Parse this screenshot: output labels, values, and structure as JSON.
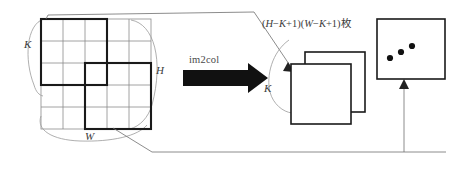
{
  "figure": {
    "kind": "im2col-diagram",
    "background": "#ffffff",
    "stroke_light": "#8c8c8c",
    "stroke_bold": "#1a1a1a",
    "arrow_fill": "#111111",
    "text_color": "#3b3b3b",
    "labels": {
      "k_left": "K",
      "h_right": "H",
      "w_bottom": "W",
      "k_right": "K",
      "operation": "im2col",
      "formula_h": "H",
      "formula_k1": "K",
      "formula_w": "W",
      "formula_k2": "K",
      "formula_open1": "(",
      "formula_minus1": "−",
      "formula_plus1": "+1)",
      "formula_open2": "(",
      "formula_minus2": "−",
      "formula_plus2": "+1)",
      "formula_counter": "枚"
    },
    "input_grid": {
      "rows": 5,
      "cols": 5,
      "cell_px": 22,
      "origin_x": 41,
      "origin_y": 19
    },
    "kernel_windows": [
      {
        "name": "kernel-window-top-left",
        "row": 0,
        "col": 0,
        "size": 3
      },
      {
        "name": "kernel-window-bottom-mid",
        "row": 2,
        "col": 1,
        "size": 3
      }
    ],
    "output_patches": [
      {
        "name": "output-patch-back",
        "x": 305,
        "y": 52,
        "w": 60,
        "h": 60
      },
      {
        "name": "output-patch-front",
        "x": 291,
        "y": 64,
        "w": 60,
        "h": 60
      },
      {
        "name": "output-patch-last",
        "x": 377,
        "y": 19,
        "w": 68,
        "h": 60
      }
    ],
    "ellipsis_dots": [
      {
        "cx": 390,
        "cy": 58
      },
      {
        "cx": 400,
        "cy": 53
      },
      {
        "cx": 410,
        "cy": 48
      }
    ]
  }
}
